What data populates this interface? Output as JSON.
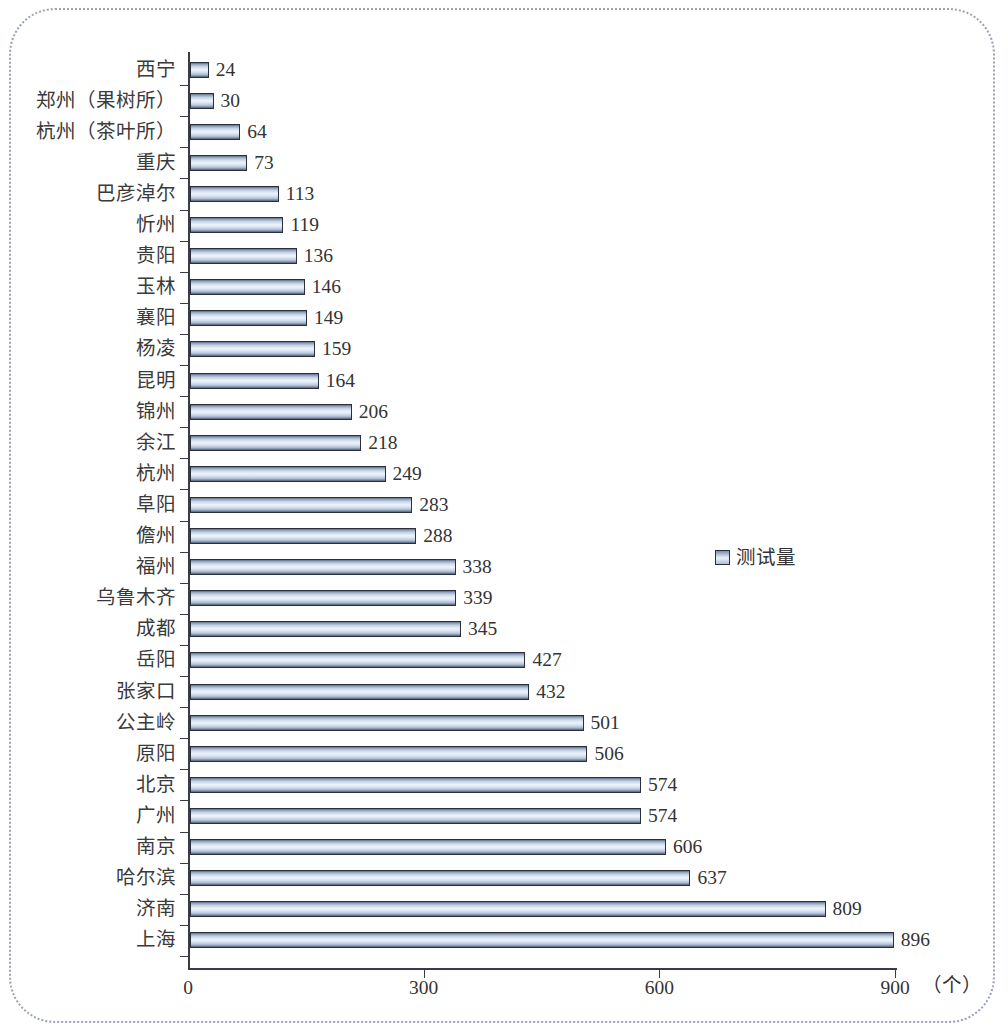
{
  "chart_data": {
    "type": "bar",
    "orientation": "horizontal",
    "title": "",
    "xlabel": "（个）",
    "ylabel": "",
    "xlim": [
      0,
      900
    ],
    "xticks": [
      "0",
      "300",
      "600",
      "900"
    ],
    "xtick_values": [
      0,
      300,
      600,
      900
    ],
    "grid": false,
    "legend_position": "middle-right",
    "legend": [
      "测试量"
    ],
    "categories": [
      "西宁",
      "郑州（果树所）",
      "杭州（茶叶所）",
      "重庆",
      "巴彦淖尔",
      "忻州",
      "贵阳",
      "玉林",
      "襄阳",
      "杨凌",
      "昆明",
      "锦州",
      "余江",
      "杭州",
      "阜阳",
      "儋州",
      "福州",
      "乌鲁木齐",
      "成都",
      "岳阳",
      "张家口",
      "公主岭",
      "原阳",
      "北京",
      "广州",
      "南京",
      "哈尔滨",
      "济南",
      "上海"
    ],
    "values": [
      24,
      30,
      64,
      73,
      113,
      119,
      136,
      146,
      149,
      159,
      164,
      206,
      218,
      249,
      283,
      288,
      338,
      339,
      345,
      427,
      432,
      501,
      506,
      574,
      574,
      606,
      637,
      809,
      896
    ],
    "series": [
      {
        "name": "测试量",
        "values": [
          24,
          30,
          64,
          73,
          113,
          119,
          136,
          146,
          149,
          159,
          164,
          206,
          218,
          249,
          283,
          288,
          338,
          339,
          345,
          427,
          432,
          501,
          506,
          574,
          574,
          606,
          637,
          809,
          896
        ]
      }
    ],
    "bar_color": "#c9d8ea",
    "bar_border_color": "#2a2f3d",
    "axis_color": "#3b3b46",
    "frame_color": "#9aa3b5"
  }
}
